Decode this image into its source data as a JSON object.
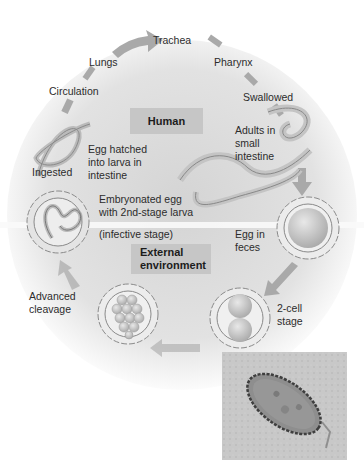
{
  "figure": {
    "zones": {
      "human": "Human",
      "external_line1": "External",
      "external_line2": "environment"
    },
    "stages": {
      "trachea": "Trachea",
      "lungs": "Lungs",
      "pharynx": "Pharynx",
      "circulation": "Circulation",
      "swallowed": "Swallowed",
      "adults_line1": "Adults in",
      "adults_line2": "small",
      "adults_line3": "intestine",
      "hatched_line1": "Egg hatched",
      "hatched_line2": "into larva in",
      "hatched_line3": "intestine",
      "ingested": "Ingested",
      "embryonated_line1": "Embryonated egg",
      "embryonated_line2": "with 2nd-stage larva",
      "infective": "(infective stage)",
      "feces_line1": "Egg in",
      "feces_line2": "feces",
      "two_cell_line1": "2-cell",
      "two_cell_line2": "stage",
      "cleavage_line1": "Advanced",
      "cleavage_line2": "cleavage"
    },
    "colors": {
      "background_center": "#d6d6d6",
      "arrow": "#a8a8a8",
      "label_box": "#c6c6c6",
      "egg_fill": "#eeeeee",
      "egg_outline": "#8a8a8a"
    }
  }
}
